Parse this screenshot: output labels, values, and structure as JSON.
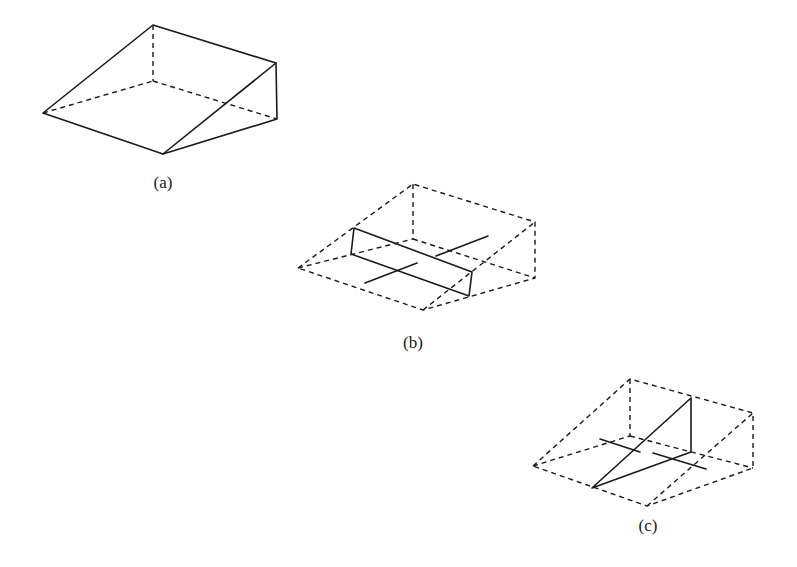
{
  "figures": [
    {
      "id": "a",
      "label": "(a)",
      "label_pos": [
        163,
        183
      ]
    },
    {
      "id": "b",
      "label": "(b)",
      "label_pos": [
        413,
        343
      ]
    },
    {
      "id": "c",
      "label": "(c)",
      "label_pos": [
        648,
        526
      ]
    }
  ]
}
